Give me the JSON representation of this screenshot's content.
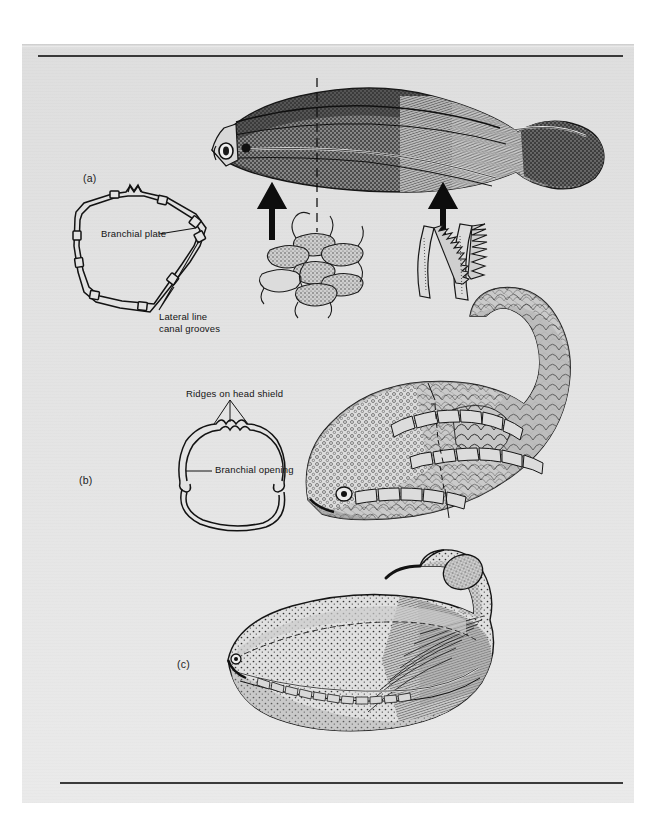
{
  "figure": {
    "kind": "scientific-illustration-plate",
    "background_color": "#e3e3e3",
    "ink_color": "#1c1c1c",
    "page_color": "#e3e3e3",
    "outer_color": "#ffffff",
    "rules": {
      "top_rule": "horizontal rule",
      "bottom_rule": "horizontal rule"
    }
  },
  "panels": [
    {
      "id": "a",
      "caption": "(a)",
      "description": "Lateral reconstruction of an armoured jawless fish with detail insets of body scales and gill arches",
      "labels": [
        {
          "name": "branchial-plate",
          "text": "Branchial plate"
        },
        {
          "name": "lateral-line-canal-grooves",
          "text": "Lateral line\ncanal grooves",
          "line1": "Lateral line",
          "line2": "canal grooves"
        }
      ],
      "callouts": [
        "arrow-scales",
        "arrow-gill-arches"
      ],
      "section_marker": "dashed vertical section line"
    },
    {
      "id": "b",
      "caption": "(b)",
      "description": "Dorsal head-shield outline and lateral reconstruction of a scaled agnathan with curved tail",
      "labels": [
        {
          "name": "ridges-on-head-shield",
          "text": "Ridges on head shield"
        },
        {
          "name": "branchial-opening",
          "text": "Branchial opening"
        }
      ]
    },
    {
      "id": "c",
      "caption": "(c)",
      "description": "Lateral reconstruction of a deep-bodied fish with upturned head",
      "labels": []
    }
  ],
  "labels_flat": {
    "caption_a": "(a)",
    "caption_b": "(b)",
    "caption_c": "(c)",
    "branchial_plate": "Branchial plate",
    "lateral_line_1": "Lateral line",
    "lateral_line_2": "canal grooves",
    "ridges_head_shield": "Ridges on head shield",
    "branchial_opening": "Branchial opening"
  }
}
